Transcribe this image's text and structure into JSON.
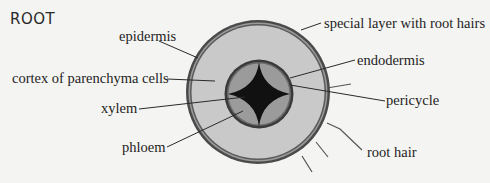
{
  "title": "ROOT",
  "colors": {
    "background": "#f4f4f2",
    "outer_ring": "#4a4a4a",
    "cortex": "#c9c9c9",
    "stele_ring": "#3a3a3a",
    "phloem": "#9b9b9b",
    "xylem": "#111111",
    "leader_line": "#2a2a2a"
  },
  "labels": {
    "epidermis": "epidermis",
    "cortex": "cortex of parenchyma cells",
    "xylem": "xylem",
    "phloem": "phloem",
    "special_layer": "special layer with root hairs",
    "endodermis": "endodermis",
    "pericycle": "pericycle",
    "root_hair": "root hair"
  }
}
